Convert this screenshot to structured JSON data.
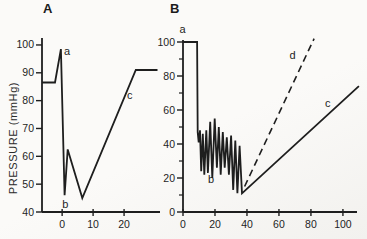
{
  "figure": {
    "background": "#f9f8f5",
    "ink": "#1e1e1e"
  },
  "chart_data": [
    {
      "panel": "A",
      "type": "line",
      "title": "A",
      "ylabel": "PRESSURE (mmHg)",
      "xlabel": "",
      "grid": false,
      "xlim": [
        -6.5,
        31.6
      ],
      "ylim": [
        40,
        102.5
      ],
      "xticks": [
        0,
        10,
        20
      ],
      "yticks": [
        40,
        50,
        60,
        70,
        80,
        90,
        100
      ],
      "yticks_minor": [],
      "series": [
        {
          "name": "pressure-trace-a",
          "style": "solid",
          "points": [
            [
              -6.5,
              86.5
            ],
            [
              -2.3,
              86.5
            ],
            [
              -0.4,
              98.5
            ],
            [
              0.8,
              46
            ],
            [
              1.8,
              62.5
            ],
            [
              6.5,
              45
            ],
            [
              23.8,
              91
            ],
            [
              30.8,
              91
            ]
          ]
        }
      ],
      "annotations": [
        {
          "label": "a",
          "x": 1.6,
          "y": 96.5
        },
        {
          "label": "b",
          "x": 1.0,
          "y": 41.5
        },
        {
          "label": "c",
          "x": 21.8,
          "y": 80.5
        }
      ]
    },
    {
      "panel": "B",
      "type": "line",
      "title": "B",
      "ylabel": "",
      "xlabel": "",
      "grid": false,
      "xlim": [
        0,
        108.8
      ],
      "ylim": [
        0,
        100
      ],
      "xticks": [
        0,
        20,
        40,
        60,
        80,
        100
      ],
      "yticks": [
        0,
        20,
        40,
        60,
        80,
        100
      ],
      "yticks_minor": [
        10,
        30,
        50,
        70,
        90
      ],
      "series": [
        {
          "name": "pressure-trace-b",
          "style": "solid",
          "points": [
            [
              0,
              100
            ],
            [
              8.8,
              100
            ],
            [
              9.2,
              47
            ],
            [
              9.8,
              41
            ],
            [
              10.6,
              48
            ],
            [
              11.4,
              24
            ],
            [
              12.4,
              46
            ],
            [
              13.3,
              22
            ],
            [
              14.6,
              48
            ],
            [
              15.6,
              23
            ],
            [
              17,
              53
            ],
            [
              18.3,
              20
            ],
            [
              19.8,
              55
            ],
            [
              21.2,
              26
            ],
            [
              22.4,
              50
            ],
            [
              23.6,
              22
            ],
            [
              24.9,
              47
            ],
            [
              26.1,
              26
            ],
            [
              27.4,
              44
            ],
            [
              28.7,
              22
            ],
            [
              30.1,
              45
            ],
            [
              31.4,
              13
            ],
            [
              32.7,
              42
            ],
            [
              34,
              11
            ],
            [
              35.4,
              39
            ],
            [
              36.9,
              11
            ],
            [
              110,
              74
            ]
          ]
        },
        {
          "name": "projected-trace-d",
          "style": "dashed",
          "points": [
            [
              38.5,
              15
            ],
            [
              82,
              102
            ]
          ]
        }
      ],
      "annotations": [
        {
          "label": "a",
          "x": -0.3,
          "y": 105.5
        },
        {
          "label": "b",
          "x": 17.5,
          "y": 17
        },
        {
          "label": "c",
          "x": 90.5,
          "y": 62
        },
        {
          "label": "d",
          "x": 68.5,
          "y": 90
        }
      ]
    }
  ]
}
